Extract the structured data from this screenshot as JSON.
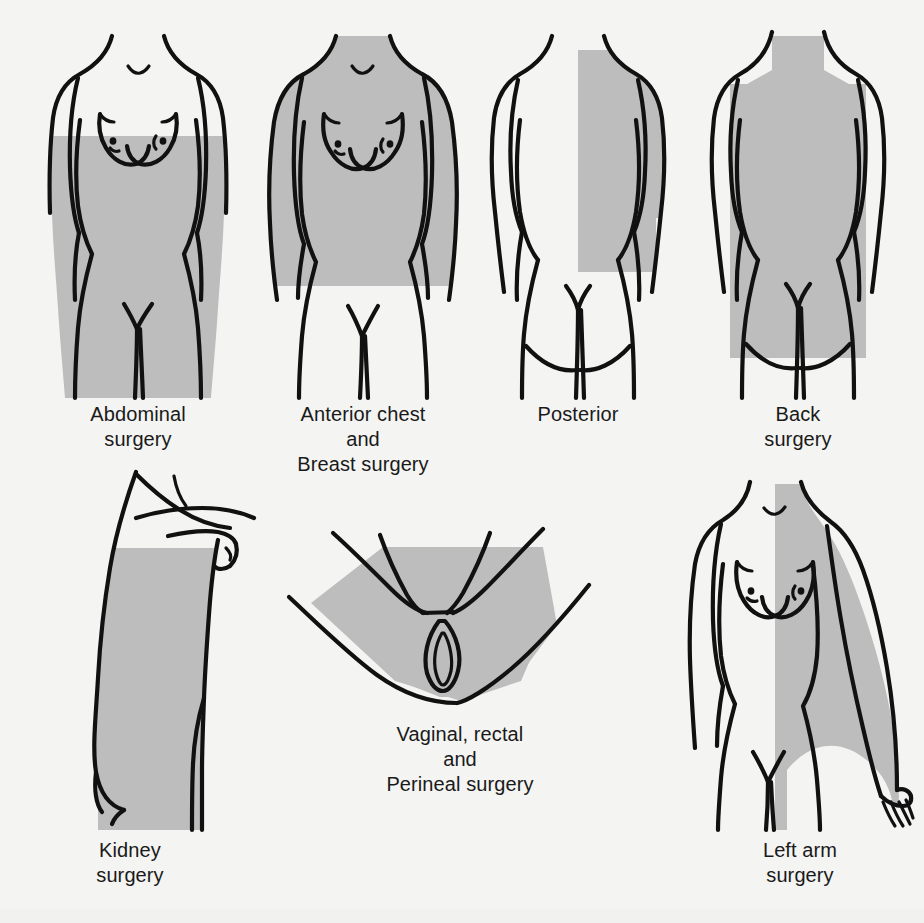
{
  "sheet": {
    "background_color": "#f4f4f2",
    "shade_color": "#bdbdbd",
    "outline_color": "#111111"
  },
  "figures": [
    {
      "id": "abdominal",
      "view": "anterior female torso",
      "caption": "Abdominal\nsurgery",
      "caption_lines": [
        "Abdominal",
        "surgery"
      ],
      "shaded_region": "chest below nipple line through abdomen, pelvis and upper thighs"
    },
    {
      "id": "anterior-chest-breast",
      "view": "anterior female torso",
      "caption": "Anterior chest\nand\nBreast surgery",
      "caption_lines": [
        "Anterior chest",
        "and",
        "Breast surgery"
      ],
      "shaded_region": "shoulders, both arms, entire chest and abdomen down to hip level"
    },
    {
      "id": "posterior",
      "view": "posterior torso",
      "caption": "Posterior",
      "caption_lines": [
        "Posterior"
      ],
      "shaded_region": "vertical band over right half of back from shoulder to below waist"
    },
    {
      "id": "back",
      "view": "posterior torso",
      "caption": "Back\nsurgery",
      "caption_lines": [
        "Back",
        "surgery"
      ],
      "shaded_region": "entire back from neck and shoulders through buttocks"
    },
    {
      "id": "kidney",
      "view": "lateral torso with raised arm",
      "caption": "Kidney\nsurgery",
      "caption_lines": [
        "Kidney",
        "surgery"
      ],
      "shaded_region": "flank and lateral trunk from axilla to hip"
    },
    {
      "id": "vaginal-rectal-perineal",
      "view": "perineum in lithotomy position",
      "caption": "Vaginal, rectal\nand\nPerineal surgery",
      "caption_lines": [
        "Vaginal, rectal",
        "and",
        "Perineal surgery"
      ],
      "shaded_region": "lower abdomen, perineum, vulva and inner thighs"
    },
    {
      "id": "left-arm",
      "view": "anterior female torso with extended arm",
      "caption": "Left arm\nsurgery",
      "caption_lines": [
        "Left arm",
        "surgery"
      ],
      "shaded_region": "entire left arm to fingers plus adjacent shoulder and chest"
    }
  ]
}
